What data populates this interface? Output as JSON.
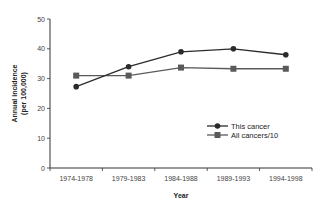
{
  "chart_data": {
    "type": "line",
    "title": "",
    "xlabel": "Year",
    "ylabel": "Annual incidence (per 100,000)",
    "ylabel_lines": [
      "Annual incidence",
      "(per 100,000)"
    ],
    "categories": [
      "1974-1978",
      "1979-1983",
      "1984-1988",
      "1989-1993",
      "1994-1998"
    ],
    "series": [
      {
        "name": "This cancer",
        "values": [
          27.3,
          34,
          39,
          40,
          38
        ],
        "color": "#2b2b2b",
        "marker": "circle"
      },
      {
        "name": "All cancers/10",
        "values": [
          31,
          31,
          33.7,
          33.3,
          33.3
        ],
        "color": "#5a5a5a",
        "marker": "square"
      }
    ],
    "ylim": [
      0,
      50
    ],
    "yticks": [
      0,
      10,
      20,
      30,
      40,
      50
    ],
    "grid": false,
    "legend_position": "lower right (inside plot)"
  }
}
